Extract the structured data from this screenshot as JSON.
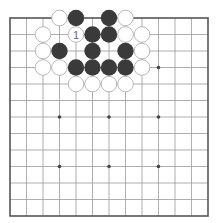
{
  "board": {
    "size": 13,
    "origin_x": 10,
    "origin_y": 18,
    "spacing": 16.5,
    "stone_radius": 8.2,
    "colors": {
      "background": "#ffffff",
      "line": "#9a9a9a",
      "border": "#555555",
      "black_stone": "#3a3a3a",
      "white_stone": "#ffffff",
      "white_stone_edge": "#a8a8a8",
      "star_point": "#444444",
      "label": "#666666"
    },
    "star_points": [
      [
        3,
        3
      ],
      [
        9,
        3
      ],
      [
        3,
        6
      ],
      [
        6,
        6
      ],
      [
        9,
        6
      ],
      [
        3,
        9
      ],
      [
        6,
        9
      ],
      [
        9,
        9
      ]
    ],
    "stones": [
      {
        "col": 3,
        "row": 0,
        "color": "white"
      },
      {
        "col": 4,
        "row": 0,
        "color": "black"
      },
      {
        "col": 6,
        "row": 0,
        "color": "black"
      },
      {
        "col": 7,
        "row": 0,
        "color": "white"
      },
      {
        "col": 2,
        "row": 1,
        "color": "white"
      },
      {
        "col": 4,
        "row": 1,
        "color": "white",
        "label": "1"
      },
      {
        "col": 5,
        "row": 1,
        "color": "black"
      },
      {
        "col": 6,
        "row": 1,
        "color": "black"
      },
      {
        "col": 7,
        "row": 1,
        "color": "white"
      },
      {
        "col": 8,
        "row": 1,
        "color": "white"
      },
      {
        "col": 2,
        "row": 2,
        "color": "white"
      },
      {
        "col": 3,
        "row": 2,
        "color": "black"
      },
      {
        "col": 5,
        "row": 2,
        "color": "black"
      },
      {
        "col": 7,
        "row": 2,
        "color": "black"
      },
      {
        "col": 8,
        "row": 2,
        "color": "white"
      },
      {
        "col": 2,
        "row": 3,
        "color": "white"
      },
      {
        "col": 3,
        "row": 3,
        "color": "white"
      },
      {
        "col": 4,
        "row": 3,
        "color": "black"
      },
      {
        "col": 5,
        "row": 3,
        "color": "black"
      },
      {
        "col": 6,
        "row": 3,
        "color": "black"
      },
      {
        "col": 7,
        "row": 3,
        "color": "black"
      },
      {
        "col": 8,
        "row": 3,
        "color": "white"
      },
      {
        "col": 4,
        "row": 4,
        "color": "white"
      },
      {
        "col": 5,
        "row": 4,
        "color": "white"
      },
      {
        "col": 6,
        "row": 4,
        "color": "white"
      },
      {
        "col": 7,
        "row": 4,
        "color": "white"
      }
    ]
  }
}
